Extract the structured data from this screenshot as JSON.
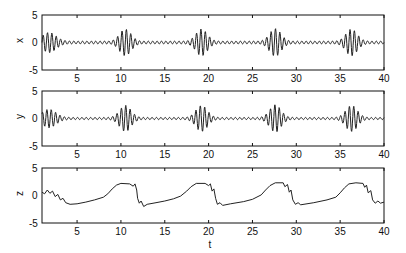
{
  "chart_data": [
    {
      "type": "line",
      "title": "",
      "xlabel": "",
      "ylabel": "x",
      "xlim": [
        1,
        40
      ],
      "ylim": [
        -5,
        5
      ],
      "xticks": [
        5,
        10,
        15,
        20,
        25,
        30,
        35,
        40
      ],
      "yticks": [
        -5,
        0,
        5
      ],
      "grid": false,
      "description": "Oscillatory signal with bursts of amplitude ~2 near t=1-3, 10, 19, 27.5, 36; small ripple (~0.3) between bursts",
      "bursts": [
        {
          "t": 1.8,
          "amp": 1.6,
          "width": 1.1
        },
        {
          "t": 10.5,
          "amp": 2.2,
          "width": 0.9
        },
        {
          "t": 19.2,
          "amp": 2.2,
          "width": 0.9
        },
        {
          "t": 27.6,
          "amp": 2.3,
          "width": 0.9
        },
        {
          "t": 36.3,
          "amp": 2.2,
          "width": 0.9
        }
      ],
      "base_ripple": 0.25,
      "period": 0.5
    },
    {
      "type": "line",
      "title": "",
      "xlabel": "",
      "ylabel": "y",
      "xlim": [
        1,
        40
      ],
      "ylim": [
        -5,
        5
      ],
      "xticks": [
        5,
        10,
        15,
        20,
        25,
        30,
        35,
        40
      ],
      "yticks": [
        -5,
        0,
        5
      ],
      "grid": false,
      "description": "Oscillatory signal similar to x, bursts near t=1-3, 10, 19, 27.5, 36",
      "bursts": [
        {
          "t": 1.8,
          "amp": 1.5,
          "width": 1.1
        },
        {
          "t": 10.5,
          "amp": 2.2,
          "width": 0.9
        },
        {
          "t": 19.2,
          "amp": 2.2,
          "width": 0.9
        },
        {
          "t": 27.6,
          "amp": 2.3,
          "width": 0.9
        },
        {
          "t": 36.3,
          "amp": 2.2,
          "width": 0.9
        }
      ],
      "base_ripple": 0.2,
      "period": 0.5
    },
    {
      "type": "line",
      "title": "",
      "xlabel": "t",
      "ylabel": "z",
      "xlim": [
        1,
        40
      ],
      "ylim": [
        -5,
        5
      ],
      "xticks": [
        5,
        10,
        15,
        20,
        25,
        30,
        35,
        40
      ],
      "yticks": [
        -5,
        0,
        5
      ],
      "grid": false,
      "description": "Sawtooth-like relaxation: slow rise from ~-1.8 to ~2.2, then abrupt drop with small wiggles near t=10.5, 19, 27.7, 36.5",
      "points": [
        [
          1,
          0.6
        ],
        [
          1.3,
          0.3
        ],
        [
          1.6,
          1.0
        ],
        [
          1.9,
          0.4
        ],
        [
          2.2,
          0.8
        ],
        [
          2.5,
          -0.2
        ],
        [
          2.8,
          0.2
        ],
        [
          3.1,
          -0.8
        ],
        [
          3.4,
          -0.5
        ],
        [
          3.7,
          -1.3
        ],
        [
          4.2,
          -1.6
        ],
        [
          5,
          -1.5
        ],
        [
          6,
          -1.2
        ],
        [
          7,
          -0.8
        ],
        [
          8,
          -0.3
        ],
        [
          8.5,
          0.3
        ],
        [
          9,
          1.2
        ],
        [
          9.5,
          1.9
        ],
        [
          10,
          2.2
        ],
        [
          11,
          2.1
        ],
        [
          11.4,
          1.7
        ],
        [
          11.6,
          2.1
        ],
        [
          11.8,
          1.0
        ],
        [
          11.9,
          -0.5
        ],
        [
          12.1,
          -1.4
        ],
        [
          12.3,
          -1.0
        ],
        [
          12.6,
          -2.0
        ],
        [
          13,
          -1.6
        ],
        [
          14,
          -1.3
        ],
        [
          15,
          -1.0
        ],
        [
          16,
          -0.6
        ],
        [
          16.8,
          -0.1
        ],
        [
          17.5,
          0.8
        ],
        [
          18,
          1.6
        ],
        [
          18.6,
          2.2
        ],
        [
          19.6,
          2.2
        ],
        [
          20,
          1.8
        ],
        [
          20.2,
          2.1
        ],
        [
          20.4,
          0.8
        ],
        [
          20.6,
          1.2
        ],
        [
          20.8,
          -0.5
        ],
        [
          21,
          -1.6
        ],
        [
          21.3,
          -1.3
        ],
        [
          21.6,
          -1.8
        ],
        [
          22.5,
          -1.5
        ],
        [
          24,
          -1.1
        ],
        [
          25,
          -0.7
        ],
        [
          26,
          0.1
        ],
        [
          26.5,
          1.0
        ],
        [
          27,
          1.8
        ],
        [
          27.6,
          2.3
        ],
        [
          28.5,
          2.3
        ],
        [
          28.7,
          1.6
        ],
        [
          29,
          2.0
        ],
        [
          29.2,
          0.6
        ],
        [
          29.4,
          1.0
        ],
        [
          29.6,
          -0.8
        ],
        [
          29.9,
          -1.6
        ],
        [
          30.2,
          -1.3
        ],
        [
          30.5,
          -1.7
        ],
        [
          32,
          -1.3
        ],
        [
          33.5,
          -0.8
        ],
        [
          34.5,
          -0.3
        ],
        [
          35,
          0.5
        ],
        [
          35.5,
          1.4
        ],
        [
          36,
          2.1
        ],
        [
          36.8,
          2.3
        ],
        [
          37.6,
          2.2
        ],
        [
          37.8,
          1.5
        ],
        [
          38,
          1.9
        ],
        [
          38.2,
          0.5
        ],
        [
          38.5,
          0.9
        ],
        [
          38.7,
          -0.8
        ],
        [
          39,
          -1.4
        ],
        [
          39.3,
          -1.0
        ],
        [
          39.6,
          -1.4
        ],
        [
          40,
          -1.2
        ]
      ]
    }
  ],
  "axes": {
    "panels": [
      {
        "ylabel": "x",
        "ytick_labels": [
          "5",
          "0",
          "-5"
        ],
        "xtick_labels": [
          "5",
          "10",
          "15",
          "20",
          "25",
          "30",
          "35",
          "40"
        ]
      },
      {
        "ylabel": "y",
        "ytick_labels": [
          "5",
          "0",
          "-5"
        ],
        "xtick_labels": [
          "5",
          "10",
          "15",
          "20",
          "25",
          "30",
          "35",
          "40"
        ]
      },
      {
        "ylabel": "z",
        "ytick_labels": [
          "5",
          "0",
          "-5"
        ],
        "xtick_labels": [
          "5",
          "10",
          "15",
          "20",
          "25",
          "30",
          "35",
          "40"
        ],
        "xlabel": "t"
      }
    ]
  }
}
